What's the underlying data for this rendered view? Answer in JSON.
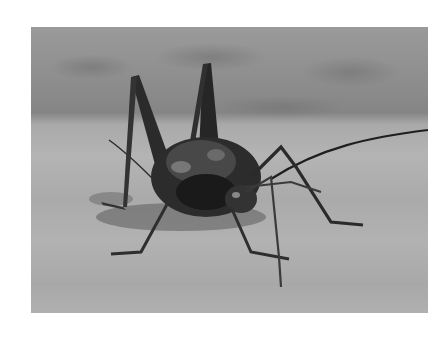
{
  "image": {
    "subject": "cave cricket on sandy ground",
    "style": "black-and-white photograph",
    "alt": "Black-and-white photograph of a long-legged cave cricket standing on a sandy surface, facing the viewer, with one long antenna extending to the right"
  },
  "colors": {
    "page_background": "#ffffff",
    "ground": "#b0b0b0",
    "background_band": "#8a8a8a",
    "insect_body": "#2a2a2a"
  }
}
